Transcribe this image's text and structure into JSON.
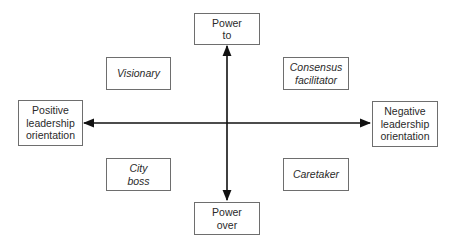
{
  "axes": {
    "vertical": {
      "top_label": "Power\nto",
      "bottom_label": "Power\nover"
    },
    "horizontal": {
      "left_label": "Positive\nleadership\norientation",
      "right_label": "Negative\nleadership\norientation"
    }
  },
  "quadrants": {
    "top_left": "Visionary",
    "top_right": "Consensus\nfacilitator",
    "bottom_left": "City\nboss",
    "bottom_right": "Caretaker"
  },
  "colors": {
    "line": "#111111",
    "box_border": "#6e6e6e",
    "text": "#2a2a2a"
  }
}
